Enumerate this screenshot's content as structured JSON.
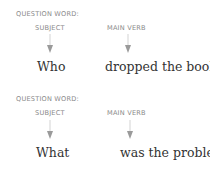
{
  "examples": [
    {
      "subject_label_line1": "QUESTION WORD:",
      "subject_label_line2": "SUBJECT",
      "verb_label": "MAIN VERB",
      "subject_word": "Who",
      "predicate": "dropped the book?"
    },
    {
      "subject_label_line1": "QUESTION WORD:",
      "subject_label_line2": "SUBJECT",
      "verb_label": "MAIN VERB",
      "subject_word": "What",
      "predicate": "was the problem?"
    }
  ],
  "colors": {
    "label": "#8a8a8a",
    "arrow": "#9a9a9a",
    "text": "#333333"
  }
}
